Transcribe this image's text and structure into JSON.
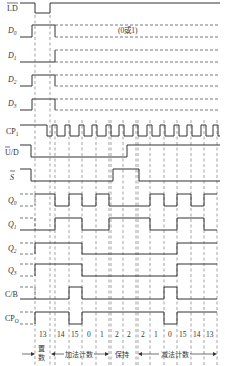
{
  "diagram": {
    "title": "",
    "signals": [
      {
        "id": "LD",
        "label": "LD",
        "overline": true
      },
      {
        "id": "D0",
        "label": "D",
        "sub": "0"
      },
      {
        "id": "D1",
        "label": "D",
        "sub": "1"
      },
      {
        "id": "D2",
        "label": "D",
        "sub": "2"
      },
      {
        "id": "D3",
        "label": "D",
        "sub": "3"
      },
      {
        "id": "CP1",
        "label": "CP",
        "sub": "1"
      },
      {
        "id": "UD",
        "label": "U/D",
        "overline_part": "U"
      },
      {
        "id": "S",
        "label": "S",
        "overline": true
      },
      {
        "id": "Q0",
        "label": "Q",
        "sub": "0"
      },
      {
        "id": "Q1",
        "label": "Q",
        "sub": "1"
      },
      {
        "id": "Q2",
        "label": "Q",
        "sub": "2"
      },
      {
        "id": "Q3",
        "label": "Q",
        "sub": "3"
      },
      {
        "id": "CB",
        "label": "C/B"
      },
      {
        "id": "CP0",
        "label": "CP",
        "sub": "O"
      }
    ],
    "annotation": "(0或1)",
    "count_values": [
      "13",
      "14",
      "15",
      "0",
      "1",
      "2",
      "2",
      "2",
      "1",
      "0",
      "15",
      "14",
      "13"
    ],
    "phases": [
      {
        "label_line1": "置",
        "label_line2": "数"
      },
      {
        "label": "加法计数"
      },
      {
        "label": "保持"
      },
      {
        "label": "减法计数"
      }
    ]
  }
}
